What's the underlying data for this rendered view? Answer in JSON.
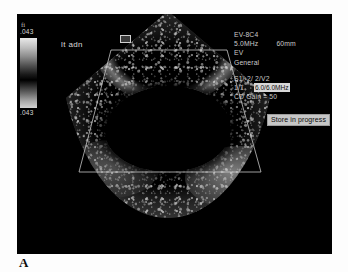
{
  "figure": {
    "panel_letter": "A"
  },
  "screen": {
    "background_color": "#000000"
  },
  "grayscale_bar": {
    "top_glyph": "fi",
    "top_value": ".043",
    "bottom_value": ".043"
  },
  "image_annotations": {
    "label": "lt adn",
    "orientation_marker": "orientation-marker"
  },
  "parameters": {
    "probe": "EV-8C4",
    "frequency": "5.0MHz",
    "depth": "60mm",
    "preset_short": "EV",
    "preset": "General",
    "settings_line": "S1/-2/ 2/V2",
    "frame_index": "1/1",
    "doppler_freq_highlight": "6.0/6.0MHz",
    "cd_gain": "CD Gain = 50"
  },
  "status": {
    "banner": "Store in progress"
  }
}
